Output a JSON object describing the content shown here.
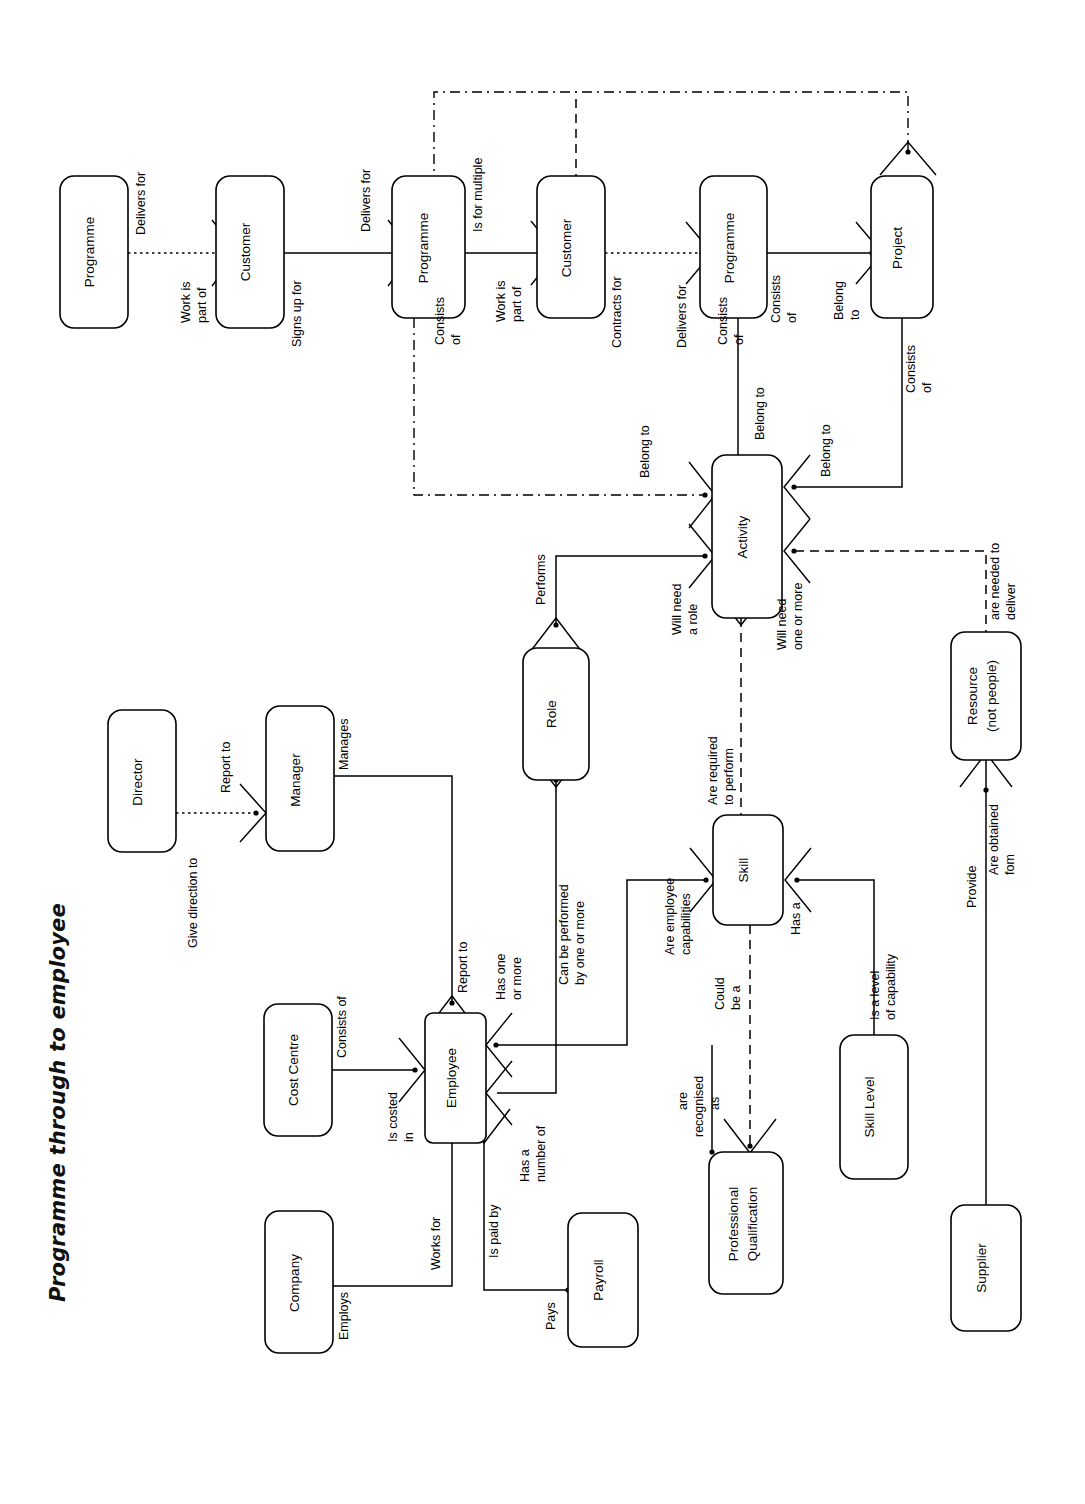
{
  "document": {
    "title": "Programme through to employee",
    "type": "entity-relationship-diagram",
    "orientation": "landscape-rotated-90"
  },
  "entities": {
    "programme_1": "Programme",
    "customer_1": "Customer",
    "programme_2": "Programme",
    "customer_2": "Customer",
    "programme_3": "Programme",
    "project": "Project",
    "activity": "Activity",
    "role": "Role",
    "skill": "Skill",
    "skill_level": "Skill Level",
    "professional_qualification": "Professional Qualification",
    "professional_qualification_l1": "Professional",
    "professional_qualification_l2": "Qualification",
    "resource": "Resource (not people)",
    "resource_l1": "Resource",
    "resource_l2": "(not people)",
    "supplier": "Supplier",
    "director": "Director",
    "manager": "Manager",
    "employee": "Employee",
    "cost_centre": "Cost Centre",
    "company": "Company",
    "payroll": "Payroll"
  },
  "relationships": {
    "delivers_for_1": "Delivers for",
    "work_is_part_of_1_a": "Work is",
    "work_is_part_of_1_b": "part of",
    "signs_up_for": "Signs up for",
    "delivers_for_2": "Delivers for",
    "is_for_multiple": "Is for multiple",
    "work_is_part_of_2_a": "Work is",
    "work_is_part_of_2_b": "part of",
    "contracts_for": "Contracts for",
    "consists_of_prog2_a": "Consists",
    "consists_of_prog2_b": "of",
    "delivers_for_3": "Delivers for",
    "consists_of_prog3_a": "Consists",
    "consists_of_prog3_b": "of",
    "consists_of_proj_a": "Consists",
    "consists_of_proj_b": "of",
    "belong_to_proj_a": "Belong",
    "belong_to_proj_b": "to",
    "consists_of_proj2_a": "Consists",
    "consists_of_proj2_b": "of",
    "belong_to_left": "Belong to",
    "belong_to_top": "Belong to",
    "belong_to_right": "Belong to",
    "performs": "Performs",
    "will_need_a_role_a": "Will need",
    "will_need_a_role_b": "a role",
    "will_need_one_or_more_a": "Will need",
    "will_need_one_or_more_b": "one or more",
    "are_needed_to_deliver_a": "are needed to",
    "are_needed_to_deliver_b": "deliver",
    "are_required_to_perform_a": "Are required",
    "are_required_to_perform_b": "to perform",
    "can_be_performed_a": "Can be performed",
    "can_be_performed_b": "by one or more",
    "are_employee_capabilities_a": "Are employee",
    "are_employee_capabilities_b": "capabilities",
    "has_a": "Has a",
    "is_a_level_of_capability_a": "Is a level",
    "is_a_level_of_capability_b": "of capability",
    "could_be_a_a": "Could",
    "could_be_a_b": "be a",
    "are_recognised_as_a": "are",
    "are_recognised_as_b": "recognised",
    "are_recognised_as_c": "as",
    "provide": "Provide",
    "are_obtained_from_a": "Are obtained",
    "are_obtained_from_b": "fom",
    "give_direction_to": "Give direction to",
    "report_to_director": "Report to",
    "manages": "Manages",
    "report_to_manager": "Report to",
    "has_one_or_more_a": "Has one",
    "has_one_or_more_b": "or more",
    "has_a_number_of_a": "Has a",
    "has_a_number_of_b": "number of",
    "consists_of_cc": "Consists of",
    "is_costed_in_a": "Is costed",
    "is_costed_in_b": "in",
    "works_for": "Works for",
    "employs": "Employs",
    "is_paid_by": "Is paid by",
    "pays": "Pays"
  }
}
